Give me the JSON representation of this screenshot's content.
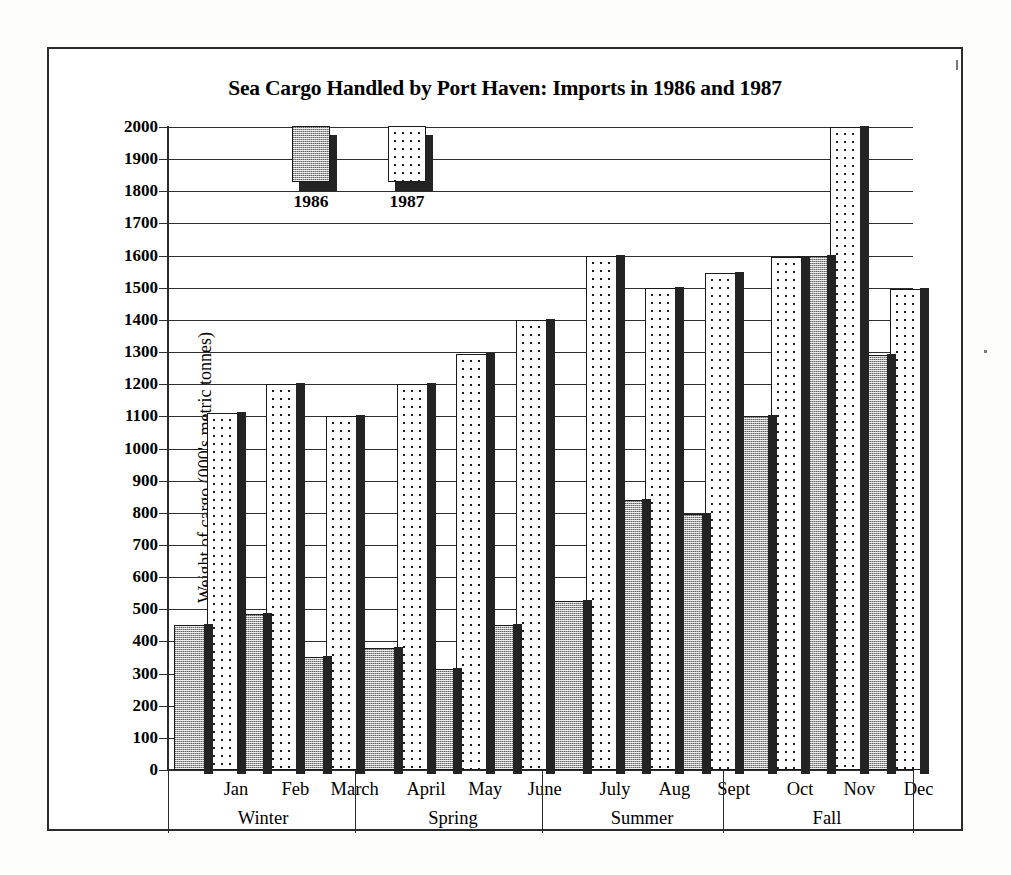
{
  "chart_data": {
    "type": "bar",
    "title": "Sea Cargo Handled by Port Haven: Imports in 1986 and 1987",
    "xlabel": "",
    "ylabel": "Weight of cargo (000's metric tonnes)",
    "ylim": [
      0,
      2000
    ],
    "ytick_step": 100,
    "grid": true,
    "legend_position": "top-left-inside",
    "categories": [
      "Jan",
      "Feb",
      "March",
      "April",
      "May",
      "June",
      "July",
      "Aug",
      "Sept",
      "Oct",
      "Nov",
      "Dec"
    ],
    "group_labels": [
      "Winter",
      "Spring",
      "Summer",
      "Fall"
    ],
    "groups": [
      {
        "name": "Winter",
        "months": [
          "Jan",
          "Feb",
          "March"
        ]
      },
      {
        "name": "Spring",
        "months": [
          "April",
          "May",
          "June"
        ]
      },
      {
        "name": "Summer",
        "months": [
          "July",
          "Aug",
          "Sept"
        ]
      },
      {
        "name": "Fall",
        "months": [
          "Oct",
          "Nov",
          "Dec"
        ]
      }
    ],
    "series": [
      {
        "name": "1986",
        "values": [
          450,
          485,
          350,
          380,
          315,
          450,
          525,
          840,
          795,
          1100,
          1600,
          1290
        ]
      },
      {
        "name": "1987",
        "values": [
          1110,
          1200,
          1100,
          1200,
          1295,
          1400,
          1600,
          1500,
          1545,
          1595,
          2000,
          1495
        ]
      }
    ],
    "ytick_labels": [
      "2000",
      "1900",
      "1800",
      "1700",
      "1600",
      "1500",
      "1400",
      "1300",
      "1200",
      "1100",
      "1000",
      "900",
      "800",
      "700",
      "600",
      "500",
      "400",
      "300",
      "200",
      "100",
      "0"
    ],
    "ytick_values": [
      2000,
      1900,
      1800,
      1700,
      1600,
      1500,
      1400,
      1300,
      1200,
      1100,
      1000,
      900,
      800,
      700,
      600,
      500,
      400,
      300,
      200,
      100,
      0
    ]
  },
  "legend": {
    "items": [
      {
        "label": "1986",
        "swatch": "dense-checker-gray"
      },
      {
        "label": "1987",
        "swatch": "sparse-dots-white"
      }
    ]
  },
  "colors": {
    "ink": "#1a1a1a",
    "grid": "#2e2e2e",
    "series_1986_fill": "#a8a8a8",
    "series_1987_fill": "#ffffff",
    "shadow": "#232323",
    "page_background": "#ffffff"
  }
}
